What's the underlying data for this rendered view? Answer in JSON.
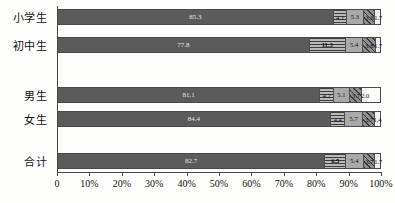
{
  "chart_data": {
    "type": "bar",
    "orientation": "horizontal",
    "stacked": true,
    "normalized_percent": true,
    "title": "",
    "xlabel": "",
    "ylabel": "",
    "xlim": [
      0,
      100
    ],
    "grid": false,
    "legend": null,
    "categories": [
      "小学生",
      "初中生",
      "男生",
      "女生",
      "合计"
    ],
    "series": [
      {
        "name": "seg1",
        "values": [
          85.3,
          77.8,
          81.1,
          84.4,
          82.7
        ]
      },
      {
        "name": "seg2",
        "values": [
          4.1,
          11.3,
          4.2,
          4.4,
          6.5
        ]
      },
      {
        "name": "seg3",
        "values": [
          5.3,
          5.4,
          5.1,
          5.7,
          5.4
        ]
      },
      {
        "name": "seg4",
        "values": [
          3.6,
          3.8,
          3.7,
          3.7,
          3.7
        ]
      },
      {
        "name": "seg5",
        "values": [
          1.7,
          1.7,
          2.0,
          1.4,
          1.7
        ]
      }
    ],
    "x_tick_labels": [
      "0",
      "10%",
      "20%",
      "30%",
      "40%",
      "50%",
      "60%",
      "70%",
      "80%",
      "90%",
      "100%"
    ],
    "x_tick_values": [
      0,
      10,
      20,
      30,
      40,
      50,
      60,
      70,
      80,
      90,
      100
    ],
    "colors": [
      "#5b5b5b",
      "#b9b9b9",
      "#a9a9a9",
      "#8e8e8e",
      "#efefef"
    ],
    "rows": [
      {
        "label": "小学生",
        "values": [
          85.3,
          4.1,
          5.3,
          3.6,
          1.7
        ],
        "value_text": [
          "85.3",
          "4.1",
          "5.3",
          "3.6",
          "1.7"
        ]
      },
      {
        "label": "初中生",
        "values": [
          77.8,
          11.3,
          5.4,
          3.8,
          1.7
        ],
        "value_text": [
          "77.8",
          "11.3",
          "5.4",
          "3.8",
          "1.7"
        ]
      },
      {
        "label": "男生",
        "values": [
          81.1,
          4.2,
          5.1,
          3.7,
          2.0
        ],
        "value_text": [
          "81.1",
          "4.2",
          "5.1",
          "3.7",
          "2.0"
        ]
      },
      {
        "label": "女生",
        "values": [
          84.4,
          4.4,
          5.7,
          3.7,
          1.4
        ],
        "value_text": [
          "84.4",
          "4.4",
          "5.7",
          "3.7",
          "1.4"
        ]
      },
      {
        "label": "合计",
        "values": [
          82.7,
          6.5,
          5.4,
          3.7,
          1.7
        ],
        "value_text": [
          "82.7",
          "6.5",
          "5.4",
          "3.7",
          "1.7"
        ]
      }
    ],
    "row_tops": [
      8,
      36,
      86,
      110,
      152
    ]
  }
}
